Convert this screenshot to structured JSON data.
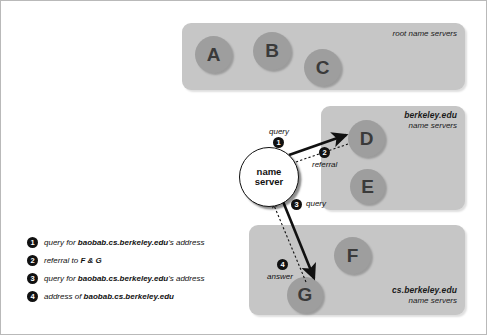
{
  "figure": {
    "colors": {
      "panel_fill": "#c6c6c6",
      "node_fill": "#9e9e9e",
      "node_text": "#3a3a3a",
      "badge_fill": "#111111",
      "page_background": "#ffffff",
      "border": "#b9b9b9"
    }
  },
  "panels": [
    {
      "id": "root",
      "label_domain": "",
      "label_sub": "root name servers",
      "nodes": [
        "A",
        "B",
        "C"
      ]
    },
    {
      "id": "berkeley",
      "label_domain": "berkeley.edu",
      "label_sub": "name servers",
      "nodes": [
        "D",
        "E"
      ]
    },
    {
      "id": "cs-berkeley",
      "label_domain": "cs.berkeley.edu",
      "label_sub": "name servers",
      "nodes": [
        "F",
        "G"
      ]
    }
  ],
  "nodes": {
    "a": "A",
    "b": "B",
    "c": "C",
    "d": "D",
    "e": "E",
    "f": "F",
    "g": "G"
  },
  "name_server": {
    "line1": "name",
    "line2": "server"
  },
  "arrows": [
    {
      "step": "1",
      "label": "query",
      "style": "solid",
      "from": "name-server",
      "to": "D"
    },
    {
      "step": "2",
      "label": "referral",
      "style": "dotted",
      "from": "D",
      "to": "name-server"
    },
    {
      "step": "3",
      "label": "query",
      "style": "solid",
      "from": "name-server",
      "to": "G"
    },
    {
      "step": "4",
      "label": "answer",
      "style": "dotted",
      "from": "G",
      "to": "name-server"
    }
  ],
  "legend": [
    {
      "step": "1",
      "pre": "query for ",
      "bold": "baobab.cs.berkeley.edu",
      "post": "'s address"
    },
    {
      "step": "2",
      "pre": "referral to ",
      "bold": "F & G",
      "post": ""
    },
    {
      "step": "3",
      "pre": "query for ",
      "bold": "baobab.cs.berkeley.edu",
      "post": "'s address"
    },
    {
      "step": "4",
      "pre": "address of ",
      "bold": "baobab.cs.berkeley.edu",
      "post": ""
    }
  ]
}
